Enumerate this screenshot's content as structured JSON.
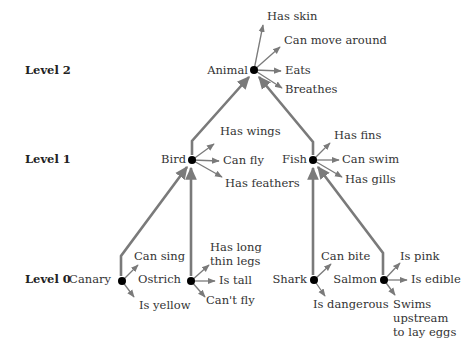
{
  "levels": [
    {
      "label": "Level 2"
    },
    {
      "label": "Level 1"
    },
    {
      "label": "Level 0"
    }
  ],
  "nodes": {
    "animal": {
      "label": "Animal",
      "attributes": [
        "Has skin",
        "Can move around",
        "Eats",
        "Breathes"
      ]
    },
    "bird": {
      "label": "Bird",
      "attributes": [
        "Has wings",
        "Can fly",
        "Has feathers"
      ]
    },
    "fish": {
      "label": "Fish",
      "attributes": [
        "Has fins",
        "Can swim",
        "Has gills"
      ]
    },
    "canary": {
      "label": "Canary",
      "attributes": [
        "Can sing",
        "Is yellow"
      ]
    },
    "ostrich": {
      "label": "Ostrich",
      "attributes": [
        "Has long thin legs",
        "Is tall",
        "Can't fly"
      ]
    },
    "shark": {
      "label": "Shark",
      "attributes": [
        "Can bite",
        "Is dangerous"
      ]
    },
    "salmon": {
      "label": "Salmon",
      "attributes": [
        "Is pink",
        "Is edible",
        "Swims upstream to lay eggs"
      ]
    }
  },
  "attr_lines": {
    "ostrich_legs": [
      "Has long",
      "thin legs"
    ],
    "salmon_swims": [
      "Swims",
      "upstream",
      "to lay eggs"
    ]
  },
  "colors": {
    "link": "#7a7a7a",
    "node": "#000000",
    "text": "#333333"
  }
}
